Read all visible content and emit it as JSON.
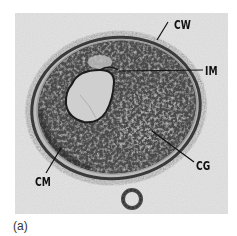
{
  "figure": {
    "panel_label": "(a)",
    "image_description": "Transmission electron micrograph of a bacterial cell cross-section",
    "annotations": [
      {
        "id": "cw",
        "text": "CW"
      },
      {
        "id": "im",
        "text": "IM"
      },
      {
        "id": "cg",
        "text": "CG"
      },
      {
        "id": "cm",
        "text": "CM"
      }
    ]
  }
}
